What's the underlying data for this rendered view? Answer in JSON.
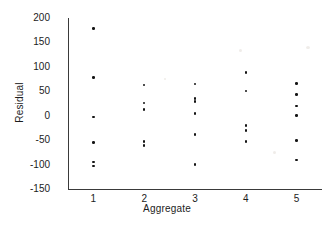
{
  "chart_data": {
    "type": "scatter",
    "title": "",
    "xlabel": "Aggregate",
    "ylabel": "Residual",
    "xlim": [
      0.5,
      5.5
    ],
    "ylim": [
      -150,
      200
    ],
    "grid": false,
    "legend": null,
    "xticks": [
      1,
      2,
      3,
      4,
      5
    ],
    "xtick_labels": [
      "1",
      "2",
      "3",
      "4",
      "5"
    ],
    "yticks": [
      200,
      150,
      100,
      50,
      0,
      -50,
      -100,
      -150
    ],
    "ytick_labels": [
      "200",
      "150",
      "100",
      "50",
      "0",
      "-50",
      "-100",
      "-150"
    ],
    "marker": "dot",
    "marker_color": "#141414",
    "series": [
      {
        "name": "residuals",
        "points": [
          {
            "x": 1,
            "y": 178
          },
          {
            "x": 1,
            "y": 78
          },
          {
            "x": 1,
            "y": -3
          },
          {
            "x": 1,
            "y": -55
          },
          {
            "x": 1,
            "y": -95
          },
          {
            "x": 1,
            "y": -103
          },
          {
            "x": 2,
            "y": 63
          },
          {
            "x": 2,
            "y": 26
          },
          {
            "x": 2,
            "y": 13
          },
          {
            "x": 2,
            "y": -53
          },
          {
            "x": 2,
            "y": -61
          },
          {
            "x": 3,
            "y": 65
          },
          {
            "x": 3,
            "y": 35
          },
          {
            "x": 3,
            "y": 29
          },
          {
            "x": 3,
            "y": 4
          },
          {
            "x": 3,
            "y": -38
          },
          {
            "x": 3,
            "y": -100
          },
          {
            "x": 4,
            "y": 89
          },
          {
            "x": 4,
            "y": 51
          },
          {
            "x": 4,
            "y": -20
          },
          {
            "x": 4,
            "y": -30
          },
          {
            "x": 4,
            "y": -53
          },
          {
            "x": 5,
            "y": 66
          },
          {
            "x": 5,
            "y": 44
          },
          {
            "x": 5,
            "y": 20
          },
          {
            "x": 5,
            "y": 0
          },
          {
            "x": 5,
            "y": -51
          },
          {
            "x": 5,
            "y": -91
          }
        ]
      }
    ]
  },
  "axes": {
    "x_title": "Aggregate",
    "y_title": "Residual"
  }
}
